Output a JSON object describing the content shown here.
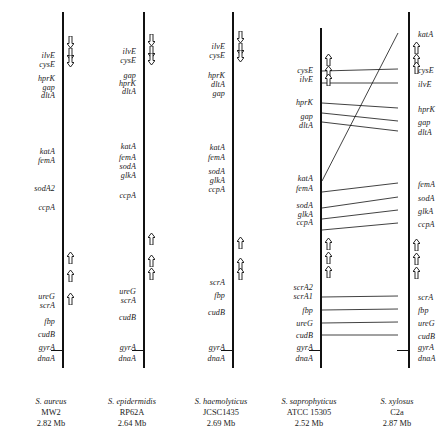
{
  "figure": {
    "type": "comparative-genome-map",
    "line_color": "#111111"
  },
  "chart_data": {
    "type": "diagram",
    "title": "",
    "xlabel": "",
    "ylabel": "",
    "columns": [
      {
        "species": "S. aureus",
        "strain": "MW2",
        "genome_size": "2.82 Mb",
        "line_x": 62,
        "line_top": 12,
        "line_bottom": 368,
        "genes": [
          {
            "name": "ilvE",
            "y": 56
          },
          {
            "name": "cysE",
            "y": 65
          },
          {
            "name": "hprK",
            "y": 79
          },
          {
            "name": "gap",
            "y": 88
          },
          {
            "name": "dltA",
            "y": 96
          },
          {
            "name": "katA",
            "y": 152
          },
          {
            "name": "femA",
            "y": 161
          },
          {
            "name": "sodA2",
            "y": 189
          },
          {
            "name": "ccpA",
            "y": 208
          },
          {
            "name": "ureG",
            "y": 297
          },
          {
            "name": "scrA",
            "y": 306
          },
          {
            "name": "fbp",
            "y": 322
          },
          {
            "name": "cudB",
            "y": 335
          },
          {
            "name": "gyrA",
            "y": 348
          },
          {
            "name": "dnaA",
            "y": 359
          }
        ],
        "ticks": [
          {
            "y": 350
          }
        ],
        "arrows": [
          {
            "y": 36,
            "dir": "down"
          },
          {
            "y": 48,
            "dir": "down"
          },
          {
            "y": 55,
            "dir": "down"
          },
          {
            "y": 252,
            "dir": "up"
          },
          {
            "y": 270,
            "dir": "up"
          },
          {
            "y": 293,
            "dir": "up"
          }
        ]
      },
      {
        "species": "S. epidermidis",
        "strain": "RP62A",
        "genome_size": "2.64 Mb",
        "line_x": 143,
        "line_top": 12,
        "line_bottom": 368,
        "genes": [
          {
            "name": "ilvE",
            "y": 52
          },
          {
            "name": "cysE",
            "y": 61
          },
          {
            "name": "gap",
            "y": 76
          },
          {
            "name": "hprK",
            "y": 84
          },
          {
            "name": "dltA",
            "y": 92
          },
          {
            "name": "katA",
            "y": 147
          },
          {
            "name": "femA",
            "y": 158
          },
          {
            "name": "sodA",
            "y": 167
          },
          {
            "name": "glkA",
            "y": 176
          },
          {
            "name": "ccpA",
            "y": 196
          },
          {
            "name": "ureG",
            "y": 292
          },
          {
            "name": "scrA",
            "y": 301
          },
          {
            "name": "cudB",
            "y": 318
          },
          {
            "name": "gyrA",
            "y": 348
          },
          {
            "name": "dnaA",
            "y": 359
          }
        ],
        "ticks": [
          {
            "y": 350
          }
        ],
        "arrows": [
          {
            "y": 34,
            "dir": "down"
          },
          {
            "y": 46,
            "dir": "down"
          },
          {
            "y": 53,
            "dir": "down"
          },
          {
            "y": 233,
            "dir": "up"
          },
          {
            "y": 255,
            "dir": "up"
          },
          {
            "y": 268,
            "dir": "up"
          }
        ]
      },
      {
        "species": "S. haemolyticus",
        "strain": "JCSC1435",
        "genome_size": "2.69 Mb",
        "line_x": 232,
        "line_top": 12,
        "line_bottom": 368,
        "genes": [
          {
            "name": "ilvE",
            "y": 47
          },
          {
            "name": "cysE",
            "y": 56
          },
          {
            "name": "hprK",
            "y": 76
          },
          {
            "name": "dltA",
            "y": 85
          },
          {
            "name": "gap",
            "y": 94
          },
          {
            "name": "katA",
            "y": 148
          },
          {
            "name": "femA",
            "y": 158
          },
          {
            "name": "sodA",
            "y": 172
          },
          {
            "name": "glkA",
            "y": 181
          },
          {
            "name": "ccpA",
            "y": 190
          },
          {
            "name": "scrA",
            "y": 283
          },
          {
            "name": "fbp",
            "y": 296
          },
          {
            "name": "cudB",
            "y": 313
          },
          {
            "name": "gyrA",
            "y": 348
          },
          {
            "name": "dnaA",
            "y": 359
          }
        ],
        "ticks": [
          {
            "y": 350
          }
        ],
        "arrows": [
          {
            "y": 31,
            "dir": "down"
          },
          {
            "y": 43,
            "dir": "down"
          },
          {
            "y": 50,
            "dir": "down"
          },
          {
            "y": 237,
            "dir": "up"
          },
          {
            "y": 258,
            "dir": "up"
          },
          {
            "y": 268,
            "dir": "up"
          }
        ]
      },
      {
        "species": "S. saprophyticus",
        "strain": "ATCC  15305",
        "genome_size": "2.52 Mb",
        "line_x": 320,
        "line_top": 28,
        "line_bottom": 368,
        "genes": [
          {
            "name": "cysE",
            "y": 71
          },
          {
            "name": "ilvE",
            "y": 80
          },
          {
            "name": "hprK",
            "y": 103
          },
          {
            "name": "gap",
            "y": 117
          },
          {
            "name": "dltA",
            "y": 126
          },
          {
            "name": "katA",
            "y": 179
          },
          {
            "name": "femA",
            "y": 189
          },
          {
            "name": "sodA",
            "y": 206
          },
          {
            "name": "glkA",
            "y": 215
          },
          {
            "name": "ccpA",
            "y": 223
          },
          {
            "name": "scrA2",
            "y": 288
          },
          {
            "name": "scrA1",
            "y": 297
          },
          {
            "name": "fbp",
            "y": 311
          },
          {
            "name": "ureG",
            "y": 324
          },
          {
            "name": "cudB",
            "y": 336
          },
          {
            "name": "gyrA",
            "y": 348
          },
          {
            "name": "dnaA",
            "y": 359
          }
        ],
        "ticks": [
          {
            "y": 350
          }
        ],
        "arrows": [
          {
            "y": 54,
            "dir": "up"
          },
          {
            "y": 66,
            "dir": "up"
          },
          {
            "y": 74,
            "dir": "up"
          },
          {
            "y": 238,
            "dir": "up"
          },
          {
            "y": 252,
            "dir": "up"
          },
          {
            "y": 266,
            "dir": "up"
          }
        ]
      },
      {
        "species": "S. xylosus",
        "strain": "C2a",
        "genome_size": "2.87 Mb",
        "line_x": 408,
        "line_top": 12,
        "line_bottom": 368,
        "genes": [
          {
            "name": "katA",
            "y": 35
          },
          {
            "name": "cysE",
            "y": 71
          },
          {
            "name": "ilvE",
            "y": 85
          },
          {
            "name": "hprK",
            "y": 110
          },
          {
            "name": "gap",
            "y": 123
          },
          {
            "name": "dltA",
            "y": 133
          },
          {
            "name": "femA",
            "y": 185
          },
          {
            "name": "sodA",
            "y": 199
          },
          {
            "name": "glkA",
            "y": 212
          },
          {
            "name": "ccpA",
            "y": 225
          },
          {
            "name": "scrA",
            "y": 298
          },
          {
            "name": "fbp",
            "y": 311
          },
          {
            "name": "ureG",
            "y": 324
          },
          {
            "name": "cudB",
            "y": 337
          },
          {
            "name": "gyrA",
            "y": 348
          },
          {
            "name": "dnaA",
            "y": 359
          }
        ],
        "ticks": [
          {
            "y": 350
          }
        ],
        "arrows": [
          {
            "y": 42,
            "dir": "up"
          },
          {
            "y": 54,
            "dir": "up"
          },
          {
            "y": 62,
            "dir": "up"
          },
          {
            "y": 239,
            "dir": "up"
          },
          {
            "y": 253,
            "dir": "up"
          },
          {
            "y": 267,
            "dir": "up"
          }
        ]
      }
    ],
    "connectors": [
      {
        "gene": "katA",
        "x1": 322,
        "y1": 181,
        "x2": 398,
        "y2": 33
      },
      {
        "gene": "cysE",
        "x1": 322,
        "y1": 71,
        "x2": 398,
        "y2": 69
      },
      {
        "gene": "ilvE",
        "x1": 322,
        "y1": 83,
        "x2": 398,
        "y2": 83
      },
      {
        "gene": "hprK",
        "x1": 322,
        "y1": 103,
        "x2": 398,
        "y2": 108
      },
      {
        "gene": "gap",
        "x1": 322,
        "y1": 113,
        "x2": 398,
        "y2": 121
      },
      {
        "gene": "dltA",
        "x1": 322,
        "y1": 122,
        "x2": 398,
        "y2": 131
      },
      {
        "gene": "femA",
        "x1": 322,
        "y1": 192,
        "x2": 398,
        "y2": 183
      },
      {
        "gene": "sodA",
        "x1": 322,
        "y1": 208,
        "x2": 398,
        "y2": 197
      },
      {
        "gene": "glkA",
        "x1": 322,
        "y1": 219,
        "x2": 398,
        "y2": 210
      },
      {
        "gene": "ccpA",
        "x1": 322,
        "y1": 230,
        "x2": 398,
        "y2": 223
      },
      {
        "gene": "scrA",
        "x1": 322,
        "y1": 297,
        "x2": 398,
        "y2": 296
      },
      {
        "gene": "fbp",
        "x1": 322,
        "y1": 310,
        "x2": 398,
        "y2": 309
      },
      {
        "gene": "ureG",
        "x1": 322,
        "y1": 323,
        "x2": 398,
        "y2": 322
      },
      {
        "gene": "cudB",
        "x1": 322,
        "y1": 335,
        "x2": 398,
        "y2": 335
      }
    ]
  }
}
